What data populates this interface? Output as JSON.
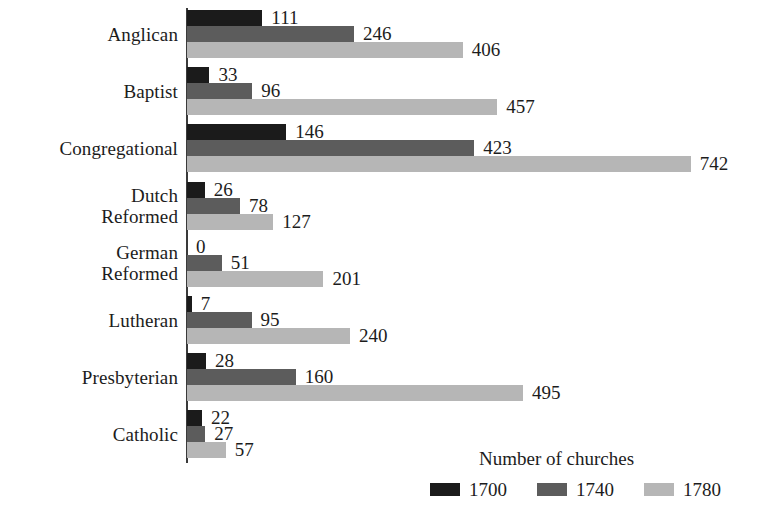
{
  "chart_data": {
    "type": "bar",
    "orientation": "horizontal",
    "title": "",
    "xlabel": "Number of churches",
    "ylabel": "",
    "grid": false,
    "legend_position": "bottom-right",
    "legend_title": "Number of churches",
    "xlim": [
      0,
      742
    ],
    "categories": [
      "Anglican",
      "Baptist",
      "Congregational",
      "Dutch\nReformed",
      "German\nReformed",
      "Lutheran",
      "Presbyterian",
      "Catholic"
    ],
    "series": [
      {
        "name": "1700",
        "color": "#1b1b1b",
        "values": [
          111,
          33,
          146,
          26,
          0,
          7,
          28,
          22
        ]
      },
      {
        "name": "1740",
        "color": "#5c5c5c",
        "values": [
          246,
          96,
          423,
          78,
          51,
          95,
          160,
          27
        ]
      },
      {
        "name": "1780",
        "color": "#b6b6b6",
        "values": [
          406,
          457,
          742,
          127,
          201,
          240,
          495,
          57
        ]
      }
    ]
  },
  "legend": {
    "title": "Number of churches",
    "entries": [
      {
        "label": "1700",
        "color": "#1b1b1b"
      },
      {
        "label": "1740",
        "color": "#5c5c5c"
      },
      {
        "label": "1780",
        "color": "#b6b6b6"
      }
    ]
  },
  "colors": {
    "series_1700": "#1b1b1b",
    "series_1740": "#5c5c5c",
    "series_1780": "#b6b6b6",
    "axis": "#3a3a3a",
    "text": "#1c1c1c",
    "background": "#ffffff"
  }
}
